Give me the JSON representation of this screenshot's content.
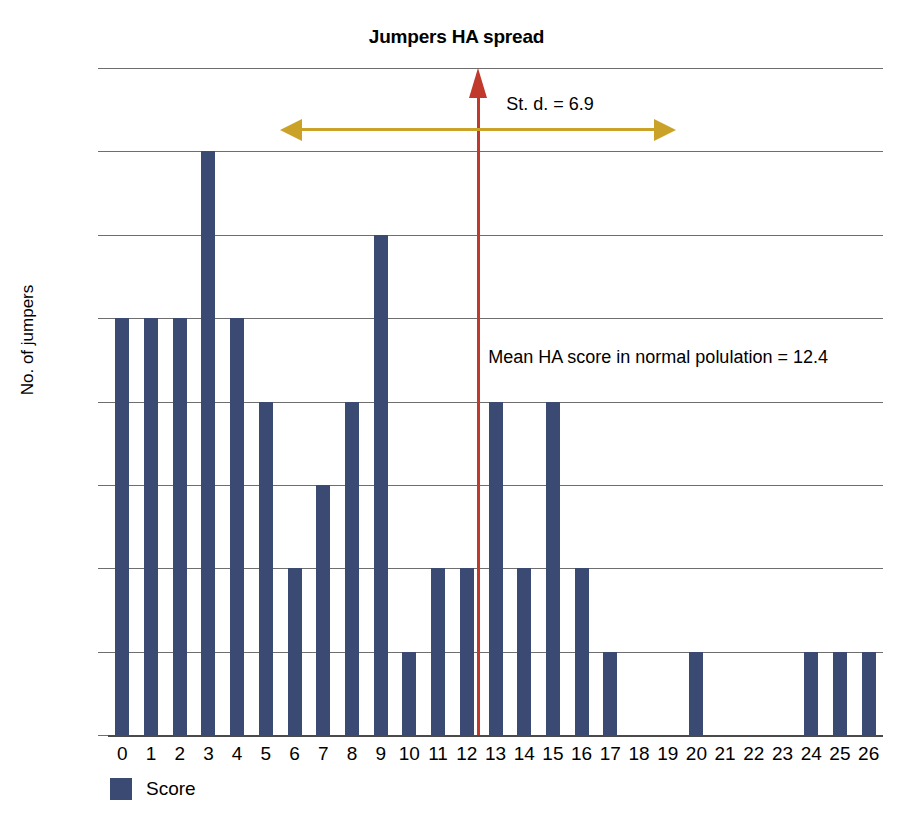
{
  "chart_data": {
    "type": "bar",
    "title": "Jumpers HA spread",
    "xlabel": "",
    "ylabel": "No. of jumpers",
    "categories": [
      "0",
      "1",
      "2",
      "3",
      "4",
      "5",
      "6",
      "7",
      "8",
      "9",
      "10",
      "11",
      "12",
      "13",
      "14",
      "15",
      "16",
      "17",
      "18",
      "19",
      "20",
      "21",
      "22",
      "23",
      "24",
      "25",
      "26"
    ],
    "values": [
      5,
      5,
      5,
      7,
      5,
      4,
      2,
      3,
      4,
      6,
      1,
      2,
      2,
      4,
      2,
      4,
      2,
      1,
      0,
      0,
      1,
      0,
      0,
      0,
      1,
      1,
      1
    ],
    "ylim": [
      0,
      8
    ],
    "ytick_labels": [
      "8.00",
      "7.00",
      "6.00",
      "5.00",
      "4.00",
      "3.00",
      "2.00",
      "1.00",
      "0"
    ],
    "ytick_values": [
      8,
      7,
      6,
      5,
      4,
      3,
      2,
      1,
      0
    ],
    "grid": true,
    "legend": {
      "position": "bottom-left",
      "entries": [
        {
          "label": "Score",
          "color": "#3a4a72"
        }
      ]
    },
    "series": [
      {
        "name": "Score",
        "color": "#3a4a72",
        "values": [
          5,
          5,
          5,
          7,
          5,
          4,
          2,
          3,
          4,
          6,
          1,
          2,
          2,
          4,
          2,
          4,
          2,
          1,
          0,
          0,
          1,
          0,
          0,
          0,
          1,
          1,
          1
        ]
      }
    ],
    "annotations": [
      {
        "name": "mean-marker",
        "text": "Mean HA score in normal polulation = 12.4",
        "value": 12.4,
        "color": "#c0392b",
        "kind": "vertical-arrow"
      },
      {
        "name": "std-dev-marker",
        "text": "St. d. = 6.9",
        "value": 6.9,
        "color": "#c9a227",
        "kind": "double-arrow"
      }
    ]
  },
  "legend": {
    "score_label": "Score"
  },
  "annotations": {
    "mean_label": "Mean HA score in normal polulation = 12.4",
    "sd_label": "St. d. = 6.9"
  }
}
